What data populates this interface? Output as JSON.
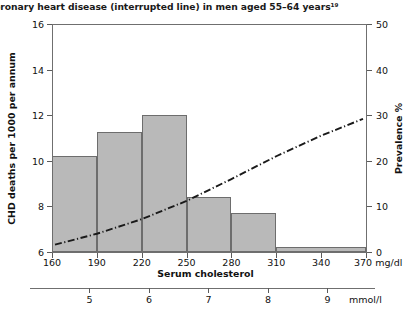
{
  "figure": {
    "caption": "oronary heart disease (interrupted line) in men aged 55–64 years¹⁹"
  },
  "chart_data": {
    "type": "bar",
    "title": "oronary heart disease (interrupted line) in men aged 55–64 years¹⁹",
    "xlabel": "Serum cholesterol",
    "ylabel": "CHD deaths per 1000 per annum",
    "y2label": "Prevalence %",
    "xlim": [
      160,
      370
    ],
    "ylim": [
      6,
      16
    ],
    "y2lim": [
      0,
      50
    ],
    "xunit": "mg/dl",
    "grid": false,
    "legend": "none",
    "x_ticks": [
      160,
      190,
      220,
      250,
      280,
      310,
      340,
      370
    ],
    "x_tick_labels": [
      "160",
      "190",
      "220",
      "250",
      "280",
      "310",
      "340",
      "370"
    ],
    "y_ticks": [
      6,
      8,
      10,
      12,
      14,
      16
    ],
    "y_tick_labels": [
      "6",
      "8",
      "10",
      "12",
      "14",
      "16"
    ],
    "y2_ticks": [
      0,
      10,
      20,
      30,
      40,
      50
    ],
    "y2_tick_labels": [
      "0",
      "10",
      "20",
      "30",
      "40",
      "50"
    ],
    "secondary_axis": {
      "label": "mmol/l",
      "ticks": [
        5,
        6,
        7,
        8,
        9
      ],
      "tick_labels": [
        "5",
        "6",
        "7",
        "8",
        "9"
      ],
      "min": 4.0,
      "max": 9.8
    },
    "series": [
      {
        "name": "CHD deaths per 1000 per annum",
        "type": "bar",
        "axis": "left",
        "color": "#b9b9b9",
        "edge_color": "#6d6d6d",
        "bins": [
          {
            "x0": 160,
            "x1": 190,
            "value": 10.2
          },
          {
            "x0": 190,
            "x1": 220,
            "value": 11.25
          },
          {
            "x0": 220,
            "x1": 250,
            "value": 12.0
          },
          {
            "x0": 250,
            "x1": 280,
            "value": 8.4
          },
          {
            "x0": 280,
            "x1": 310,
            "value": 7.7
          },
          {
            "x0": 310,
            "x1": 370,
            "value": 6.2
          }
        ]
      },
      {
        "name": "Prevalence (interrupted line)",
        "type": "line",
        "axis": "right",
        "style": "dash-dot",
        "color": "#1a1a1a",
        "points": [
          {
            "x": 162,
            "y": 1.6
          },
          {
            "x": 190,
            "y": 4.0
          },
          {
            "x": 220,
            "y": 7.2
          },
          {
            "x": 250,
            "y": 11.2
          },
          {
            "x": 280,
            "y": 16.0
          },
          {
            "x": 310,
            "y": 21.0
          },
          {
            "x": 340,
            "y": 25.5
          },
          {
            "x": 368,
            "y": 29.2
          }
        ]
      }
    ]
  }
}
